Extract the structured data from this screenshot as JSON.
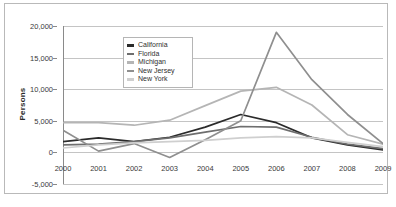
{
  "chart_data": {
    "type": "line",
    "title": "",
    "xlabel": "",
    "ylabel": "Persons",
    "x": [
      2000,
      2001,
      2002,
      2003,
      2004,
      2005,
      2006,
      2007,
      2008,
      2009
    ],
    "xtick_labels": [
      "2000",
      "2001",
      "2002",
      "2003",
      "2004",
      "2005",
      "2006",
      "2007",
      "2008",
      "2009"
    ],
    "ytick_labels": [
      "20,000",
      "15,000",
      "10,000",
      "5,000",
      "0",
      "-5,000"
    ],
    "ytick_values": [
      20000,
      15000,
      10000,
      5000,
      0,
      -5000
    ],
    "ylim": [
      -5000,
      20000
    ],
    "grid": true,
    "legend_position": "upper-left-inside",
    "series": [
      {
        "name": "California",
        "color": "#2b2b2b",
        "values": [
          1700,
          2300,
          1700,
          2400,
          4000,
          6000,
          4700,
          2300,
          1200,
          400
        ]
      },
      {
        "name": "Florida",
        "color": "#6e6e6e",
        "values": [
          1200,
          1300,
          1700,
          2300,
          3200,
          4100,
          4000,
          2400,
          1300,
          600
        ]
      },
      {
        "name": "Michigan",
        "color": "#b5b5b5",
        "values": [
          4700,
          4700,
          4300,
          5100,
          7400,
          9700,
          10300,
          7500,
          2800,
          1300
        ]
      },
      {
        "name": "New Jersey",
        "color": "#8f8f8f",
        "values": [
          3500,
          200,
          1400,
          -800,
          2000,
          5000,
          19000,
          11500,
          6000,
          1400
        ]
      },
      {
        "name": "New York",
        "color": "#cfcfcf",
        "values": [
          700,
          1200,
          1500,
          1700,
          1900,
          2300,
          2500,
          2300,
          1600,
          900
        ]
      }
    ]
  }
}
